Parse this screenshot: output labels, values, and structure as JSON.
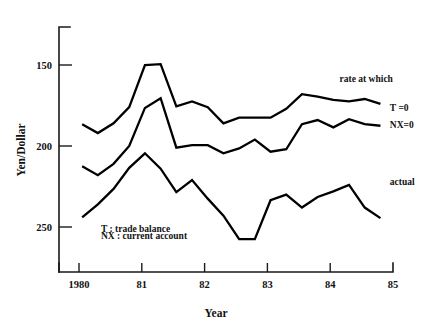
{
  "chart_data": {
    "type": "line",
    "title": "",
    "xlabel": "Year",
    "ylabel": "Yen/Dollar",
    "y_inverted": true,
    "ylim": [
      255,
      140
    ],
    "xlim": [
      1980,
      1985
    ],
    "grid": false,
    "legend_position": "inline-right",
    "y_ticks": [
      150,
      200,
      250
    ],
    "y_tick_labels": [
      "150",
      "200",
      "250"
    ],
    "x_ticks": [
      1980,
      1981,
      1982,
      1983,
      1984,
      1985
    ],
    "x_tick_labels": [
      "1980",
      "81",
      "82",
      "83",
      "84",
      "85"
    ],
    "annotations": [
      {
        "name": "rate-at-which",
        "text": "rate at which",
        "x": 1984.15,
        "y": 160.5
      },
      {
        "name": "legend-trade-balance",
        "text": "T : trade balance",
        "x": 1980.35,
        "y": 253.0
      },
      {
        "name": "legend-current-account",
        "text": "NX : current account",
        "x": 1980.35,
        "y": 257.5
      }
    ],
    "series": [
      {
        "name": "T =0",
        "label": "T =0",
        "label_x": 1984.95,
        "label_y": 176.5,
        "color": "#000000",
        "x": [
          1980.05,
          1980.3,
          1980.55,
          1980.8,
          1981.05,
          1981.3,
          1981.55,
          1981.8,
          1982.05,
          1982.3,
          1982.55,
          1982.8,
          1983.05,
          1983.3,
          1983.55,
          1983.8,
          1984.05,
          1984.3,
          1984.55,
          1984.8
        ],
        "y": [
          186.5,
          192.0,
          186.0,
          176.0,
          150.0,
          149.5,
          175.5,
          172.5,
          176.0,
          186.0,
          182.5,
          182.5,
          182.5,
          177.0,
          168.0,
          169.5,
          171.5,
          172.5,
          171.0,
          174.0
        ]
      },
      {
        "name": "NX=0",
        "label": "NX=0",
        "label_x": 1984.95,
        "label_y": 187.0,
        "color": "#000000",
        "x": [
          1980.05,
          1980.3,
          1980.55,
          1980.8,
          1981.05,
          1981.3,
          1981.55,
          1981.8,
          1982.05,
          1982.3,
          1982.55,
          1982.8,
          1983.05,
          1983.3,
          1983.55,
          1983.8,
          1984.05,
          1984.3,
          1984.55,
          1984.8
        ],
        "y": [
          212.5,
          218.0,
          211.0,
          200.0,
          176.5,
          170.5,
          201.0,
          199.5,
          199.5,
          204.5,
          201.5,
          196.0,
          203.5,
          202.0,
          186.5,
          184.0,
          188.5,
          183.5,
          186.5,
          187.5
        ]
      },
      {
        "name": "actual",
        "label": "actual",
        "label_x": 1984.95,
        "label_y": 222.0,
        "color": "#000000",
        "x": [
          1980.05,
          1980.3,
          1980.55,
          1980.8,
          1981.05,
          1981.3,
          1981.55,
          1981.8,
          1982.05,
          1982.3,
          1982.55,
          1982.8,
          1983.05,
          1983.3,
          1983.55,
          1983.8,
          1984.05,
          1984.3,
          1984.55,
          1984.8
        ],
        "y": [
          244.0,
          236.0,
          226.5,
          213.5,
          204.5,
          214.0,
          228.5,
          221.0,
          232.5,
          243.0,
          257.5,
          257.5,
          233.5,
          230.0,
          238.0,
          231.5,
          228.0,
          224.0,
          238.0,
          244.5
        ]
      }
    ]
  },
  "axes": {
    "y_title": "Yen/Dollar",
    "x_title": "Year"
  }
}
